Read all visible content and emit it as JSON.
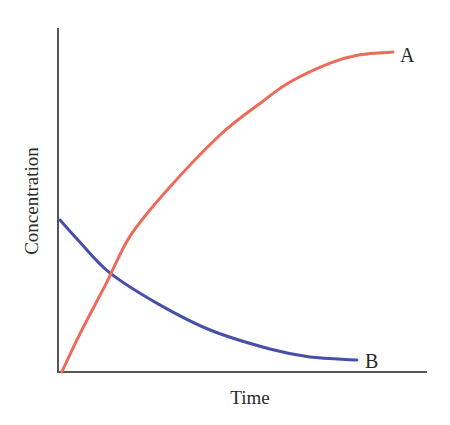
{
  "chart_data": {
    "type": "line",
    "title": "",
    "xlabel": "Time",
    "ylabel": "Concentration",
    "xlim": [
      0,
      10
    ],
    "ylim": [
      0,
      100
    ],
    "grid": false,
    "legend": "none (series labeled at line ends)",
    "ticks": {
      "x": [],
      "y": []
    },
    "series": [
      {
        "name": "A",
        "color": "#ee6a5a",
        "description": "rises from 0 and levels off (approaches plateau)",
        "points": [
          [
            0.05,
            0
          ],
          [
            0.54,
            11.0
          ],
          [
            1.28,
            26.2
          ],
          [
            1.91,
            39.5
          ],
          [
            2.92,
            52.9
          ],
          [
            4.36,
            68.9
          ],
          [
            5.5,
            78.5
          ],
          [
            6.27,
            84.3
          ],
          [
            7.36,
            89.8
          ],
          [
            8.17,
            92.2
          ],
          [
            9.07,
            93.0
          ]
        ]
      },
      {
        "name": "B",
        "color": "#4650a8",
        "description": "decays from initial value toward near zero",
        "points": [
          [
            0,
            44.2
          ],
          [
            0.54,
            37.8
          ],
          [
            1.36,
            28.8
          ],
          [
            2.72,
            19.5
          ],
          [
            4.09,
            12.2
          ],
          [
            5.72,
            6.7
          ],
          [
            6.81,
            4.4
          ],
          [
            8.09,
            3.5
          ]
        ]
      }
    ],
    "annotations": [
      {
        "text": "A",
        "at_series_end": "A"
      },
      {
        "text": "B",
        "at_series_end": "B"
      }
    ]
  },
  "labels": {
    "x_axis": "Time",
    "y_axis": "Concentration",
    "series_a": "A",
    "series_b": "B"
  },
  "colors": {
    "axis": "#555555",
    "series_a": "#ee6a5a",
    "series_b": "#4650a8"
  }
}
